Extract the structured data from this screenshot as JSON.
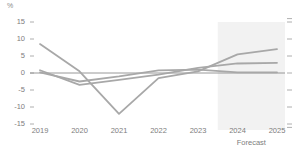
{
  "chart_data": {
    "type": "line",
    "title": "",
    "subtitle": "",
    "xlabel": "",
    "ylabel": "%",
    "unit_label": "%",
    "x": [
      "2019",
      "2020",
      "2021",
      "2022",
      "2023",
      "2024",
      "2025"
    ],
    "categories": [
      "2019",
      "2020",
      "2021",
      "2022",
      "2023",
      "2024",
      "2025"
    ],
    "ylim": [
      -17,
      16
    ],
    "yticks": [
      15,
      10,
      5,
      0,
      -5,
      -10,
      -15
    ],
    "ytick_labels": [
      "15",
      "10",
      "5",
      "0",
      "-5",
      "-10",
      "-15"
    ],
    "xtick_labels": [
      "2019",
      "2020",
      "2021",
      "2022",
      "2023",
      "2024",
      "2025"
    ],
    "grid": false,
    "legend": "none",
    "zero_line": true,
    "series": [
      {
        "name": "series-1",
        "color": "#a8a8a8",
        "values": [
          8.5,
          0.5,
          -12.0,
          -1.5,
          0.5,
          5.5,
          7.0
        ]
      },
      {
        "name": "series-2",
        "color": "#a8a8a8",
        "values": [
          0.8,
          -3.5,
          -2.0,
          -0.5,
          1.5,
          2.8,
          3.0
        ]
      },
      {
        "name": "series-3",
        "color": "#a8a8a8",
        "values": [
          0.2,
          -2.5,
          -1.0,
          0.8,
          1.0,
          0.2,
          0.2
        ]
      }
    ],
    "annotations": [
      {
        "name": "forecast-band",
        "label": "Forecast",
        "start_x": "2023.5",
        "end_x": "2025",
        "color": "#f2f2f2"
      }
    ]
  },
  "axis": {
    "unit": "%",
    "y_labels": [
      "15",
      "10",
      "5",
      "0",
      "-5",
      "-10",
      "-15"
    ],
    "x_labels": [
      "2019",
      "2020",
      "2021",
      "2022",
      "2023",
      "2024",
      "2025"
    ]
  },
  "forecast": {
    "caption": "Forecast"
  },
  "colors": {
    "line": "#a8a8a8",
    "zero_axis": "#8c8c8c",
    "tick": "#9a9a9a",
    "text": "#7d7d7d",
    "forecast_band": "#f2f2f2"
  }
}
